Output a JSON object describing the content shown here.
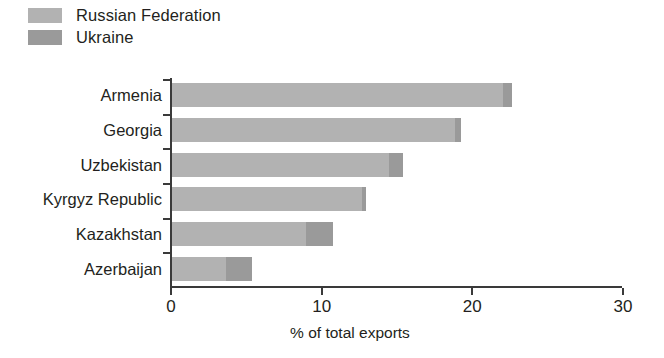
{
  "chart_data": {
    "type": "bar",
    "orientation": "horizontal",
    "stacked": true,
    "title": "",
    "xlabel": "% of total exports",
    "ylabel": "",
    "xlim": [
      0,
      30
    ],
    "xticks": [
      0,
      10,
      20,
      30
    ],
    "xtick_labels": [
      "0",
      "10",
      "20",
      "30"
    ],
    "grid": false,
    "legend_position": "top-left",
    "categories": [
      "Armenia",
      "Georgia",
      "Uzbekistan",
      "Kyrgyz Republic",
      "Kazakhstan",
      "Azerbaijan"
    ],
    "series": [
      {
        "name": "Russian Federation",
        "color": "#b2b2b2",
        "values": [
          22.0,
          18.8,
          14.4,
          12.6,
          8.9,
          3.6
        ]
      },
      {
        "name": "Ukraine",
        "color": "#9a9a9a",
        "values": [
          0.6,
          0.4,
          0.9,
          0.3,
          1.8,
          1.7
        ]
      }
    ],
    "totals": [
      22.6,
      19.2,
      15.3,
      12.9,
      10.7,
      5.3
    ]
  },
  "legend": {
    "items": [
      {
        "label": "Russian Federation",
        "color": "#b2b2b2"
      },
      {
        "label": "Ukraine",
        "color": "#9a9a9a"
      }
    ]
  },
  "axis": {
    "x_title": "% of total exports"
  },
  "colors": {
    "russia": "#b2b2b2",
    "ukraine": "#9a9a9a",
    "axis": "#3a3a3a",
    "text": "#231f20",
    "background": "#ffffff"
  }
}
